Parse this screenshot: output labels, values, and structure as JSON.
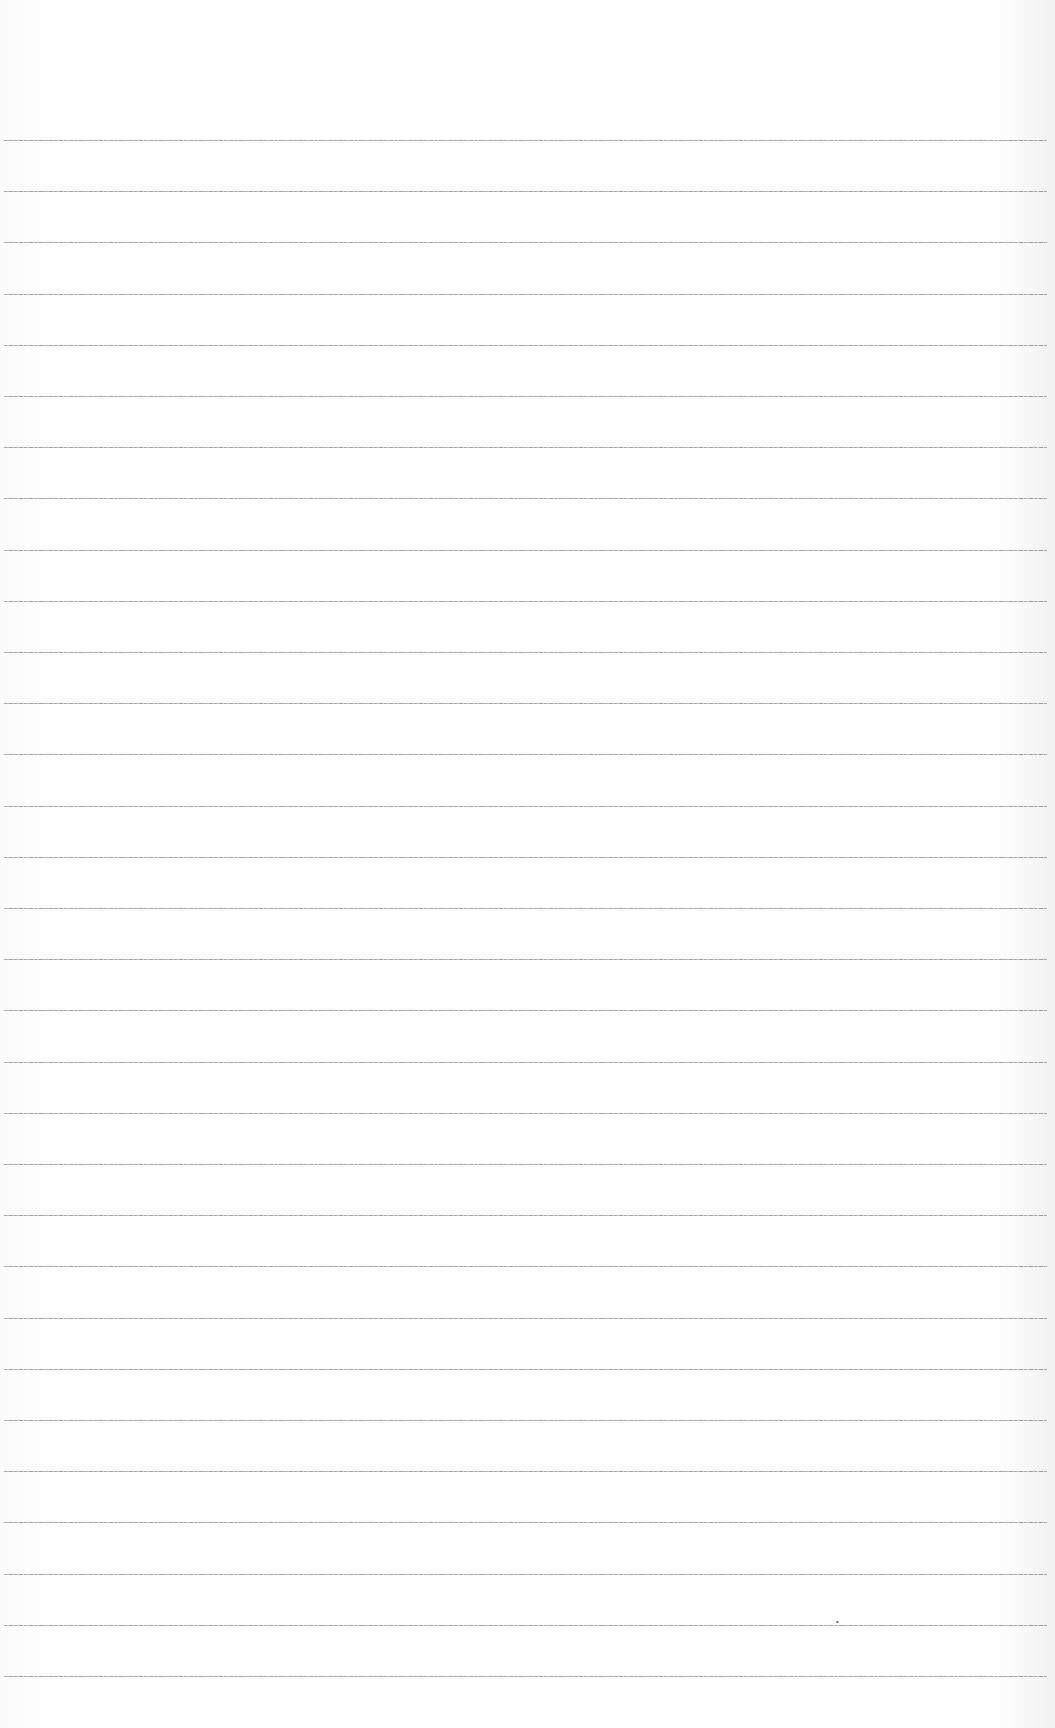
{
  "page": {
    "type": "lined-paper",
    "background_color": "#fdfdfd",
    "line_color": "#9a9a9a",
    "line_count": 31,
    "first_line_y": 140,
    "line_spacing": 51.2
  },
  "marks": [
    {
      "glyph": "•",
      "x": 836,
      "y": 1618
    }
  ]
}
